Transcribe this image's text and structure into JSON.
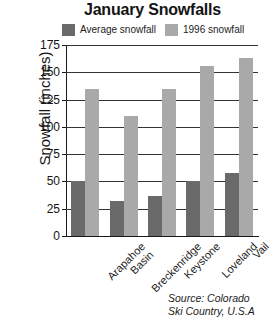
{
  "chart_data": {
    "type": "bar",
    "title": "January Snowfalls",
    "xlabel": "",
    "ylabel": "Snowfall (inches)",
    "categories": [
      "Arapahoe Basin",
      "Breckenridge",
      "Keystone",
      "Loveland",
      "Vail"
    ],
    "category_lines": [
      [
        "Arapahoe",
        "Basin"
      ],
      [
        "Breckenridge"
      ],
      [
        "Keystone"
      ],
      [
        "Loveland"
      ],
      [
        "Vail"
      ]
    ],
    "series": [
      {
        "name": "Average snowfall",
        "color": "#6a6a6a",
        "values": [
          50,
          32,
          37,
          50,
          58
        ]
      },
      {
        "name": "1996 snowfall",
        "color": "#a9a9a9",
        "values": [
          135,
          110,
          135,
          156,
          163
        ]
      }
    ],
    "ylim": [
      0,
      175
    ],
    "yticks": [
      0,
      25,
      50,
      75,
      100,
      125,
      150,
      175
    ],
    "ytick_labels": [
      "0",
      "25",
      "50",
      "75",
      "100",
      "125",
      "150",
      "175"
    ],
    "grid": true,
    "grid_axis": "y",
    "legend_position": "top",
    "annotations": [
      "Source: Colorado",
      "Ski Country, U.S.A"
    ]
  },
  "source": {
    "line1": "Source: Colorado",
    "line2": "Ski Country, U.S.A"
  }
}
